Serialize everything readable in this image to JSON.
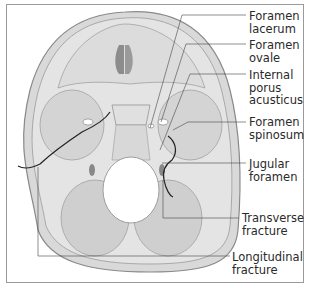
{
  "figure": {
    "colors": {
      "bone": "#d6d6d6",
      "fossa": "#c8c8c8",
      "outline": "#8a8a8a",
      "fracture": "#222222",
      "frame": "#9a9a9a"
    }
  },
  "labels": [
    {
      "id": "foramen-lacerum",
      "line1": "Foramen",
      "line2": "lacerum",
      "line3": ""
    },
    {
      "id": "foramen-ovale",
      "line1": "Foramen",
      "line2": "ovale",
      "line3": ""
    },
    {
      "id": "internal-porus-acusticus",
      "line1": "Internal",
      "line2": "porus",
      "line3": "acusticus"
    },
    {
      "id": "foramen-spinosum",
      "line1": "Foramen",
      "line2": "spinosum",
      "line3": ""
    },
    {
      "id": "jugular-foramen",
      "line1": "Jugular",
      "line2": "foramen",
      "line3": ""
    },
    {
      "id": "transverse-fracture",
      "line1": "Transverse",
      "line2": "fracture",
      "line3": ""
    },
    {
      "id": "longitudinal-fracture",
      "line1": "Longitudinal",
      "line2": "fracture",
      "line3": ""
    }
  ]
}
